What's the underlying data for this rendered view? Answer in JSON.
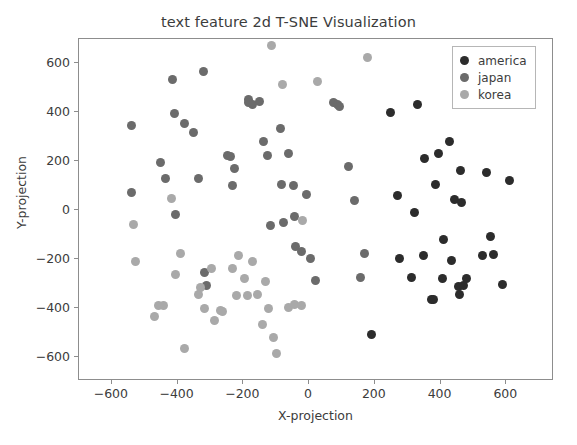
{
  "chart_data": {
    "type": "scatter",
    "title": "text feature 2d T-SNE Visualization",
    "xlabel": "X-projection",
    "ylabel": "Y-projection",
    "xlim": [
      -700,
      745
    ],
    "ylim": [
      -700,
      700
    ],
    "xticks": [
      -600,
      -400,
      -200,
      0,
      200,
      400,
      600
    ],
    "xticklabels": [
      "−600",
      "−400",
      "−200",
      "0",
      "200",
      "400",
      "600"
    ],
    "yticks": [
      -600,
      -400,
      -200,
      0,
      200,
      400,
      600
    ],
    "yticklabels": [
      "−600",
      "−400",
      "−200",
      "0",
      "200",
      "400",
      "600"
    ],
    "grid": false,
    "legend_position": "upper right",
    "marker_size": 9,
    "series": [
      {
        "name": "america",
        "color": "#2c2c2c",
        "points": [
          [
            190,
            -510
          ],
          [
            249,
            400
          ],
          [
            270,
            60
          ],
          [
            274,
            -200
          ],
          [
            311,
            -275
          ],
          [
            322,
            -10
          ],
          [
            330,
            430
          ],
          [
            349,
            -185
          ],
          [
            352,
            210
          ],
          [
            371,
            -368
          ],
          [
            378,
            -365
          ],
          [
            386,
            105
          ],
          [
            393,
            230
          ],
          [
            406,
            -280
          ],
          [
            410,
            -120
          ],
          [
            428,
            280
          ],
          [
            433,
            -205
          ],
          [
            443,
            45
          ],
          [
            454,
            -312
          ],
          [
            459,
            -345
          ],
          [
            462,
            160
          ],
          [
            465,
            30
          ],
          [
            479,
            -280
          ],
          [
            527,
            -185
          ],
          [
            539,
            152
          ],
          [
            552,
            -108
          ],
          [
            562,
            -182
          ],
          [
            588,
            -305
          ],
          [
            611,
            120
          ],
          [
            470,
            -310
          ]
        ]
      },
      {
        "name": "japan",
        "color": "#6b6b6b",
        "points": [
          [
            -540,
            345
          ],
          [
            -540,
            72
          ],
          [
            -452,
            195
          ],
          [
            -437,
            130
          ],
          [
            -417,
            533
          ],
          [
            -410,
            393
          ],
          [
            -405,
            -18
          ],
          [
            -378,
            355
          ],
          [
            -352,
            318
          ],
          [
            -337,
            128
          ],
          [
            -320,
            568
          ],
          [
            -318,
            -255
          ],
          [
            -312,
            -310
          ],
          [
            -247,
            223
          ],
          [
            -240,
            218
          ],
          [
            -232,
            100
          ],
          [
            -228,
            168
          ],
          [
            -185,
            452
          ],
          [
            -183,
            440
          ],
          [
            -173,
            432
          ],
          [
            -150,
            445
          ],
          [
            -138,
            280
          ],
          [
            -128,
            222
          ],
          [
            -118,
            -62
          ],
          [
            -88,
            333
          ],
          [
            -85,
            105
          ],
          [
            -78,
            -52
          ],
          [
            -62,
            230
          ],
          [
            -48,
            102
          ],
          [
            -44,
            -28
          ],
          [
            -40,
            -150
          ],
          [
            -22,
            -170
          ],
          [
            -8,
            65
          ],
          [
            4,
            -200
          ],
          [
            18,
            -290
          ],
          [
            75,
            440
          ],
          [
            86,
            430
          ],
          [
            93,
            425
          ],
          [
            120,
            180
          ],
          [
            138,
            40
          ],
          [
            155,
            -275
          ],
          [
            167,
            -180
          ]
        ]
      },
      {
        "name": "korea",
        "color": "#a9a9a9",
        "points": [
          [
            -534,
            -58
          ],
          [
            -528,
            -210
          ],
          [
            -470,
            -438
          ],
          [
            -459,
            -392
          ],
          [
            -442,
            -390
          ],
          [
            -420,
            48
          ],
          [
            -406,
            -262
          ],
          [
            -390,
            -178
          ],
          [
            -378,
            -568
          ],
          [
            -335,
            -345
          ],
          [
            -330,
            -318
          ],
          [
            -318,
            -405
          ],
          [
            -298,
            -240
          ],
          [
            -287,
            -452
          ],
          [
            -270,
            -410
          ],
          [
            -262,
            -415
          ],
          [
            -234,
            -238
          ],
          [
            -222,
            -348
          ],
          [
            -215,
            -185
          ],
          [
            -198,
            -282
          ],
          [
            -188,
            -352
          ],
          [
            -172,
            -212
          ],
          [
            -158,
            -345
          ],
          [
            -142,
            -468
          ],
          [
            -132,
            -292
          ],
          [
            -125,
            -405
          ],
          [
            -115,
            672
          ],
          [
            -108,
            -520
          ],
          [
            -98,
            -588
          ],
          [
            -82,
            512
          ],
          [
            -62,
            -398
          ],
          [
            -45,
            -385
          ],
          [
            -22,
            -390
          ],
          [
            -20,
            -42
          ],
          [
            25,
            528
          ],
          [
            178,
            625
          ]
        ]
      }
    ]
  },
  "legend": {
    "entries": [
      {
        "label": "america",
        "color": "#2c2c2c"
      },
      {
        "label": "japan",
        "color": "#6b6b6b"
      },
      {
        "label": "korea",
        "color": "#a9a9a9"
      }
    ]
  }
}
